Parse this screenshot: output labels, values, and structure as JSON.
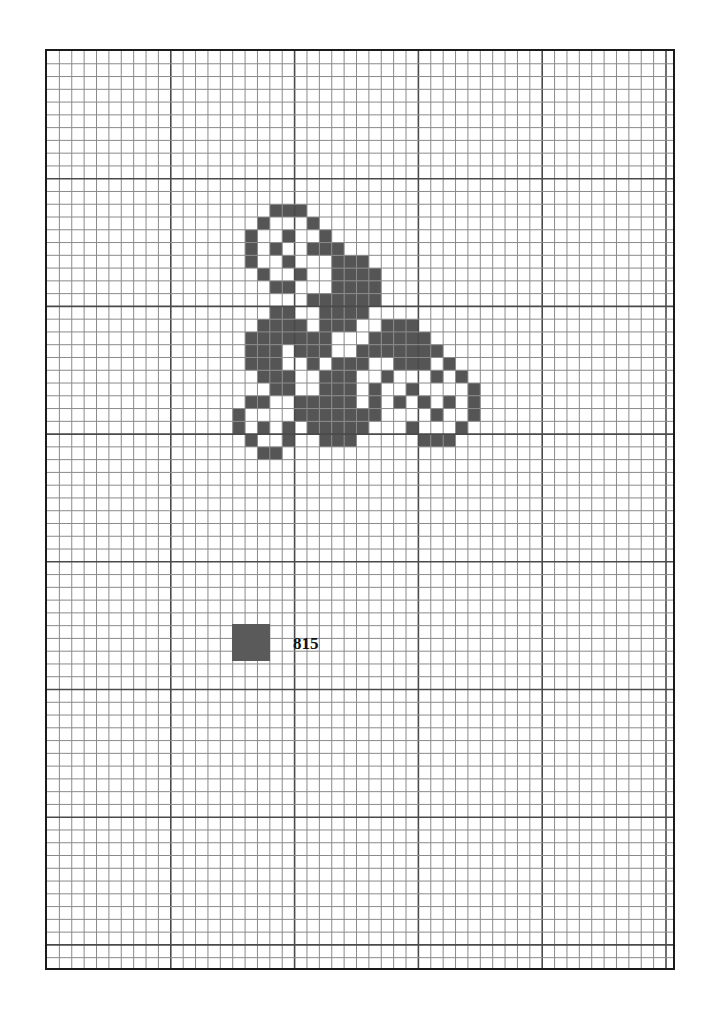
{
  "pattern": {
    "type": "cross-stitch-chart",
    "grid": {
      "columns": 51,
      "rows": 72,
      "cell_width": 12.38,
      "cell_height": 12.77,
      "major_every": 10,
      "line_color": "#8a8a8a",
      "major_line_color": "#4a4a4a",
      "border_color": "#1a1a1a"
    },
    "stitch_color": "#555555",
    "stitches": {
      "12": [
        18,
        19,
        20
      ],
      "13": [
        17,
        21
      ],
      "14": [
        16,
        19,
        22
      ],
      "15": [
        16,
        18,
        21,
        22,
        23
      ],
      "16": [
        16,
        19,
        23,
        24,
        25
      ],
      "17": [
        17,
        20,
        23,
        24,
        25,
        26
      ],
      "18": [
        18,
        19,
        23,
        24,
        25,
        26
      ],
      "19": [
        21,
        22,
        23,
        24,
        25,
        26
      ],
      "20": [
        18,
        19,
        22,
        23,
        24,
        25
      ],
      "21": [
        17,
        18,
        19,
        20,
        22,
        23,
        24,
        27,
        28,
        29
      ],
      "22": [
        16,
        17,
        18,
        19,
        20,
        21,
        22,
        26,
        27,
        28,
        29,
        30
      ],
      "23": [
        16,
        17,
        18,
        20,
        21,
        22,
        25,
        26,
        27,
        28,
        29,
        30,
        31
      ],
      "24": [
        16,
        17,
        18,
        21,
        23,
        24,
        25,
        28,
        29,
        30,
        32
      ],
      "25": [
        17,
        18,
        19,
        22,
        23,
        24,
        27,
        31,
        33
      ],
      "26": [
        18,
        19,
        22,
        23,
        24,
        26,
        29,
        34
      ],
      "27": [
        16,
        17,
        20,
        21,
        22,
        23,
        24,
        26,
        28,
        30,
        32,
        34
      ],
      "28": [
        15,
        20,
        21,
        22,
        23,
        24,
        25,
        26,
        31,
        34
      ],
      "29": [
        15,
        17,
        19,
        21,
        22,
        23,
        24,
        25,
        29,
        33
      ],
      "30": [
        16,
        19,
        22,
        23,
        24,
        30,
        31,
        32
      ],
      "31": [
        17,
        18
      ]
    }
  },
  "legend": {
    "items": [
      {
        "swatch_color": "#5a5a5a",
        "label": "815"
      }
    ]
  }
}
